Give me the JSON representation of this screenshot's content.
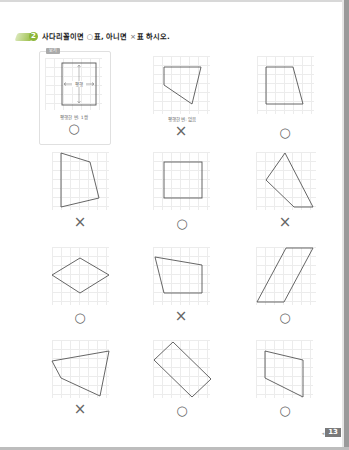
{
  "header": {
    "problem_number": "2",
    "title_part1": "사다리꼴이면",
    "circle_symbol": "○",
    "title_part2": "표, 아니면",
    "cross_symbol": "×",
    "title_part3": "표 하시오."
  },
  "example": {
    "tag": "보기",
    "inner_label": "평행",
    "caption": "평행한 변: 1쌍",
    "answer": "○"
  },
  "items": [
    {
      "caption": "평행한 변: 없음",
      "answer": "×"
    },
    {
      "caption": "",
      "answer": "○"
    },
    {
      "caption": "",
      "answer": "×"
    },
    {
      "caption": "",
      "answer": "○"
    },
    {
      "caption": "",
      "answer": "×"
    },
    {
      "caption": "",
      "answer": "○"
    },
    {
      "caption": "",
      "answer": "×"
    },
    {
      "caption": "",
      "answer": "○"
    },
    {
      "caption": "",
      "answer": "×"
    },
    {
      "caption": "",
      "answer": "○"
    },
    {
      "caption": "",
      "answer": "○"
    }
  ],
  "footer": {
    "page_number": "13"
  },
  "colors": {
    "accent_green": "#8cb63a",
    "line": "#555555",
    "grid": "#ececec"
  }
}
